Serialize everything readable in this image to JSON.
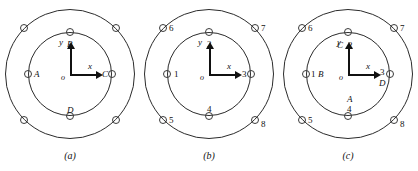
{
  "figure": {
    "background": "#ffffff",
    "line_color": "#2b2b2b",
    "panels": [
      {
        "id": "a",
        "caption": "(a)",
        "axes": {
          "x": "x",
          "y": "y",
          "origin": "o"
        },
        "inner_labels": [
          {
            "name": "inner-top",
            "text": "B",
            "italic": true
          },
          {
            "name": "inner-right",
            "text": "C",
            "italic": true
          },
          {
            "name": "inner-bottom",
            "text": "D",
            "italic": true
          },
          {
            "name": "inner-left",
            "text": "A",
            "italic": true
          }
        ],
        "outer_labels": []
      },
      {
        "id": "b",
        "caption": "(b)",
        "axes": {
          "x": "x",
          "y": "y",
          "origin": "o"
        },
        "inner_labels": [
          {
            "name": "inner-top",
            "text": "2",
            "italic": false
          },
          {
            "name": "inner-right",
            "text": "3",
            "italic": false
          },
          {
            "name": "inner-bottom",
            "text": "4",
            "italic": false
          },
          {
            "name": "inner-left",
            "text": "1",
            "italic": false
          }
        ],
        "outer_labels": [
          {
            "name": "outer-top-left",
            "text": "6",
            "italic": false
          },
          {
            "name": "outer-top-right",
            "text": "7",
            "italic": false
          },
          {
            "name": "outer-bottom-right",
            "text": "8",
            "italic": false
          },
          {
            "name": "outer-bottom-left",
            "text": "5",
            "italic": false
          }
        ]
      },
      {
        "id": "c",
        "caption": "(c)",
        "axes": {
          "x": "x",
          "y": "y",
          "origin": "o"
        },
        "inner_labels": [
          {
            "name": "inner-top",
            "text": "2",
            "italic": false
          },
          {
            "name": "inner-right",
            "text": "3",
            "italic": false
          },
          {
            "name": "inner-bottom",
            "text": "4",
            "italic": false
          },
          {
            "name": "inner-left",
            "text": "1",
            "italic": false
          }
        ],
        "inner_letter_labels": [
          {
            "name": "inner-top-letter",
            "text": "C",
            "italic": true
          },
          {
            "name": "inner-right-letter",
            "text": "D",
            "italic": true
          },
          {
            "name": "inner-bottom-letter",
            "text": "A",
            "italic": true
          },
          {
            "name": "inner-left-letter",
            "text": "B",
            "italic": true
          }
        ],
        "outer_labels": [
          {
            "name": "outer-top-left",
            "text": "6",
            "italic": false
          },
          {
            "name": "outer-top-right",
            "text": "7",
            "italic": false
          },
          {
            "name": "outer-bottom-right",
            "text": "8",
            "italic": false
          },
          {
            "name": "outer-bottom-left",
            "text": "5",
            "italic": false
          }
        ]
      }
    ]
  }
}
